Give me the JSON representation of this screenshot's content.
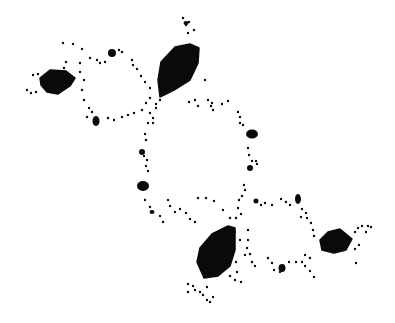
{
  "image": {
    "description": "Black-and-white fractal (Julia-set-like dendrite) with large filled lobes connected by dotted loops",
    "background": "#ffffff",
    "ink": "#0a0a0a"
  },
  "blobs": [
    {
      "name": "left-lobe",
      "points": "40,78 50,70 66,71 75,78 70,86 58,94 47,92 41,85"
    },
    {
      "name": "top-center-lobe",
      "points": "161,62 175,47 190,44 199,48 198,63 190,80 174,90 160,97 158,80"
    },
    {
      "name": "bottom-center-lobe",
      "points": "200,248 212,234 228,226 235,228 235,250 230,266 218,276 204,278 197,262"
    },
    {
      "name": "right-lobe",
      "points": "320,240 328,232 340,229 352,239 346,250 334,253 322,250"
    }
  ],
  "small_blobs": [
    {
      "cx": 112,
      "cy": 53,
      "rx": 4,
      "ry": 4
    },
    {
      "cx": 96,
      "cy": 121,
      "rx": 3.5,
      "ry": 5
    },
    {
      "cx": 252,
      "cy": 134,
      "rx": 6,
      "ry": 4.5
    },
    {
      "cx": 143,
      "cy": 186,
      "rx": 6,
      "ry": 5
    },
    {
      "cx": 142,
      "cy": 152,
      "rx": 3,
      "ry": 3
    },
    {
      "cx": 298,
      "cy": 199,
      "rx": 3,
      "ry": 5
    },
    {
      "cx": 282,
      "cy": 268,
      "rx": 3.5,
      "ry": 4
    },
    {
      "cx": 250,
      "cy": 168,
      "rx": 3,
      "ry": 3
    },
    {
      "cx": 186,
      "cy": 23,
      "rx": 2.5,
      "ry": 2
    },
    {
      "cx": 152,
      "cy": 212,
      "rx": 2.5,
      "ry": 2
    },
    {
      "cx": 256,
      "cy": 201,
      "rx": 2.5,
      "ry": 2.5
    }
  ],
  "dots": [
    [
      63,
      43
    ],
    [
      73,
      44
    ],
    [
      82,
      49
    ],
    [
      80,
      63
    ],
    [
      66,
      62
    ],
    [
      64,
      68
    ],
    [
      90,
      58
    ],
    [
      97,
      60
    ],
    [
      100,
      63
    ],
    [
      105,
      62
    ],
    [
      119,
      50
    ],
    [
      122,
      52
    ],
    [
      132,
      60
    ],
    [
      137,
      69
    ],
    [
      141,
      76
    ],
    [
      145,
      82
    ],
    [
      150,
      88
    ],
    [
      133,
      65
    ],
    [
      33,
      75
    ],
    [
      38,
      74
    ],
    [
      27,
      90
    ],
    [
      31,
      93
    ],
    [
      36,
      92
    ],
    [
      80,
      72
    ],
    [
      84,
      80
    ],
    [
      82,
      90
    ],
    [
      84,
      100
    ],
    [
      89,
      108
    ],
    [
      92,
      112
    ],
    [
      87,
      117
    ],
    [
      108,
      118
    ],
    [
      114,
      120
    ],
    [
      122,
      117
    ],
    [
      128,
      115
    ],
    [
      134,
      113
    ],
    [
      142,
      110
    ],
    [
      146,
      103
    ],
    [
      150,
      98
    ],
    [
      148,
      123
    ],
    [
      145,
      134
    ],
    [
      183,
      18
    ],
    [
      186,
      25
    ],
    [
      188,
      33
    ],
    [
      194,
      30
    ],
    [
      189,
      22
    ],
    [
      205,
      80
    ],
    [
      208,
      100
    ],
    [
      212,
      103
    ],
    [
      222,
      104
    ],
    [
      228,
      101
    ],
    [
      150,
      113
    ],
    [
      156,
      108
    ],
    [
      160,
      100
    ],
    [
      156,
      104
    ],
    [
      153,
      118
    ],
    [
      153,
      123
    ],
    [
      146,
      140
    ],
    [
      144,
      156
    ],
    [
      147,
      160
    ],
    [
      146,
      166
    ],
    [
      148,
      171
    ],
    [
      145,
      200
    ],
    [
      150,
      207
    ],
    [
      160,
      216
    ],
    [
      163,
      222
    ],
    [
      189,
      102
    ],
    [
      195,
      100
    ],
    [
      198,
      106
    ],
    [
      211,
      106
    ],
    [
      213,
      110
    ],
    [
      238,
      112
    ],
    [
      240,
      117
    ],
    [
      243,
      125
    ],
    [
      240,
      123
    ],
    [
      248,
      148
    ],
    [
      249,
      155
    ],
    [
      252,
      161
    ],
    [
      256,
      161
    ],
    [
      257,
      164
    ],
    [
      244,
      185
    ],
    [
      245,
      190
    ],
    [
      242,
      196
    ],
    [
      239,
      200
    ],
    [
      238,
      208
    ],
    [
      241,
      214
    ],
    [
      236,
      218
    ],
    [
      198,
      198
    ],
    [
      206,
      198
    ],
    [
      214,
      201
    ],
    [
      223,
      210
    ],
    [
      230,
      218
    ],
    [
      168,
      200
    ],
    [
      170,
      206
    ],
    [
      175,
      212
    ],
    [
      180,
      209
    ],
    [
      186,
      213
    ],
    [
      190,
      219
    ],
    [
      195,
      222
    ],
    [
      261,
      205
    ],
    [
      265,
      203
    ],
    [
      272,
      205
    ],
    [
      281,
      199
    ],
    [
      286,
      202
    ],
    [
      290,
      205
    ],
    [
      302,
      209
    ],
    [
      306,
      213
    ],
    [
      307,
      218
    ],
    [
      311,
      223
    ],
    [
      313,
      230
    ],
    [
      314,
      236
    ],
    [
      301,
      217
    ],
    [
      240,
      240
    ],
    [
      247,
      248
    ],
    [
      250,
      254
    ],
    [
      252,
      262
    ],
    [
      255,
      266
    ],
    [
      268,
      258
    ],
    [
      272,
      263
    ],
    [
      274,
      270
    ],
    [
      280,
      272
    ],
    [
      289,
      262
    ],
    [
      296,
      262
    ],
    [
      302,
      262
    ],
    [
      305,
      266
    ],
    [
      310,
      271
    ],
    [
      314,
      277
    ],
    [
      310,
      258
    ],
    [
      305,
      255
    ],
    [
      358,
      228
    ],
    [
      362,
      226
    ],
    [
      368,
      226
    ],
    [
      366,
      232
    ],
    [
      355,
      232
    ],
    [
      359,
      245
    ],
    [
      355,
      249
    ],
    [
      356,
      263
    ],
    [
      371,
      227
    ],
    [
      188,
      284
    ],
    [
      193,
      286
    ],
    [
      195,
      290
    ],
    [
      200,
      292
    ],
    [
      203,
      295
    ],
    [
      207,
      300
    ],
    [
      210,
      302
    ],
    [
      213,
      297
    ],
    [
      207,
      287
    ],
    [
      188,
      292
    ],
    [
      230,
      276
    ],
    [
      235,
      280
    ],
    [
      241,
      282
    ],
    [
      237,
      272
    ],
    [
      236,
      262
    ],
    [
      245,
      255
    ],
    [
      248,
      240
    ],
    [
      248,
      230
    ],
    [
      235,
      232
    ]
  ]
}
